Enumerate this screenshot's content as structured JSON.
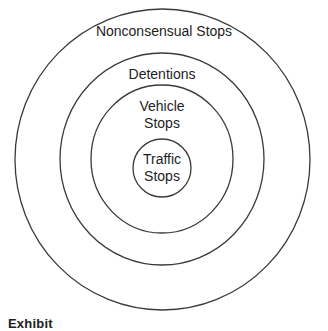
{
  "diagram": {
    "type": "nested-circles",
    "rings": [
      {
        "id": "outer",
        "label": "Nonconsensual Stops"
      },
      {
        "id": "second",
        "label": "Detentions"
      },
      {
        "id": "third",
        "label_line1": "Vehicle",
        "label_line2": "Stops"
      },
      {
        "id": "inner",
        "label_line1": "Traffic",
        "label_line2": "Stops"
      }
    ],
    "stroke_color": "#3a3a3a",
    "background_color": "#ffffff"
  },
  "caption": {
    "prefix": "Exhibit",
    "text": "(caption partially cropped)"
  }
}
